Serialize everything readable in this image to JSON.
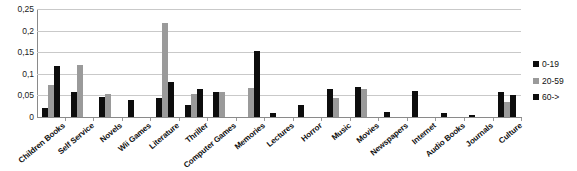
{
  "chart_data": {
    "type": "bar",
    "title": "",
    "subtitle": "",
    "xlabel": "",
    "ylabel": "",
    "ylim": [
      0,
      0.25
    ],
    "grid": true,
    "legend_position": "right",
    "ytick_labels": [
      "0,25",
      "0,2",
      "0,15",
      "0,1",
      "0,05",
      "0"
    ],
    "ytick_values": [
      0.25,
      0.2,
      0.15,
      0.1,
      0.05,
      0
    ],
    "categories": [
      "Children Books",
      "Self Service",
      "Novels",
      "Wii Games",
      "Literature",
      "Thriller",
      "Computer Games",
      "Memories",
      "Lectures",
      "Horror",
      "Music",
      "Movies",
      "Newspapers",
      "Internet",
      "Audio Books",
      "Journals",
      "Culture"
    ],
    "series": [
      {
        "name": "0-19",
        "color": "#0d0d0d",
        "values": [
          0.02,
          0.057,
          0.047,
          0.04,
          0.045,
          0.028,
          0.057,
          0.0,
          0.01,
          0.028,
          0.065,
          0.07,
          0.012,
          0.06,
          0.01,
          0.005,
          0.058
        ]
      },
      {
        "name": "20-59",
        "color": "#9a9a9a",
        "values": [
          0.073,
          0.12,
          0.053,
          0.0,
          0.218,
          0.053,
          0.057,
          0.068,
          0.0,
          0.0,
          0.045,
          0.065,
          0.0,
          0.0,
          0.0,
          0.0,
          0.035
        ]
      },
      {
        "name": "60->",
        "color": "#0d0d0d",
        "values": [
          0.118,
          0.0,
          0.0,
          0.0,
          0.082,
          0.065,
          0.0,
          0.152,
          0.0,
          0.0,
          0.0,
          0.0,
          0.0,
          0.0,
          0.0,
          0.0,
          0.05
        ]
      }
    ]
  },
  "legend": {
    "items": [
      {
        "label": "0-19",
        "color": "#0d0d0d"
      },
      {
        "label": "20-59",
        "color": "#9a9a9a"
      },
      {
        "label": "60->",
        "color": "#0d0d0d"
      }
    ]
  }
}
